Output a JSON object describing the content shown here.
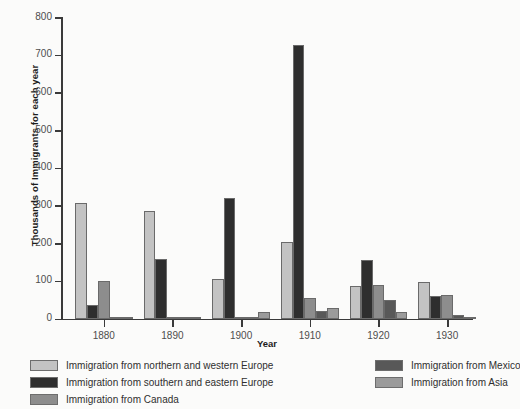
{
  "chart_data": {
    "type": "bar",
    "title": "",
    "xlabel": "Year",
    "ylabel": "Thousands of Immigrants for each year",
    "categories": [
      "1880",
      "1890",
      "1900",
      "1910",
      "1920",
      "1930"
    ],
    "ylim": [
      0,
      800
    ],
    "yticks": [
      0,
      100,
      200,
      300,
      400,
      500,
      600,
      700,
      800
    ],
    "grid": false,
    "legend_position": "bottom",
    "series": [
      {
        "name": "Immigration from northern and western Europe",
        "color": "#c3c3c3",
        "values": [
          307,
          285,
          105,
          203,
          85,
          96
        ]
      },
      {
        "name": "Immigration from southern and eastern Europe",
        "color": "#2e2e2e",
        "values": [
          37,
          159,
          320,
          725,
          155,
          59
        ]
      },
      {
        "name": "Immigration from Canada",
        "color": "#8d8d8d",
        "values": [
          100,
          3,
          2,
          55,
          89,
          63
        ]
      },
      {
        "name": "Immigration from Mexico",
        "color": "#585858",
        "values": [
          2,
          1,
          1,
          20,
          50,
          9
        ]
      },
      {
        "name": "Immigration from Asia",
        "color": "#9b9b9b",
        "values": [
          4,
          2,
          18,
          27,
          16,
          3
        ]
      }
    ]
  },
  "legend": {
    "columns": [
      [
        "Immigration from northern and western Europe",
        "Immigration from southern and eastern Europe",
        "Immigration from Canada"
      ],
      [
        "Immigration from Mexico",
        "Immigration from Asia"
      ]
    ]
  }
}
